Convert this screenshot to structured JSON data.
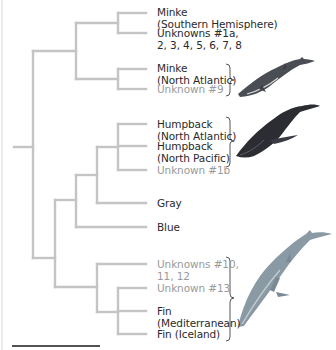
{
  "tree": {
    "branch_color": "#c4c4c4",
    "known_text_color": "#2a2a2a",
    "unknown_text_color": "#9a9a9a",
    "leaves": [
      {
        "id": "minke-sh",
        "lines": [
          "Minke",
          "(Southern Hemisphere)"
        ],
        "unknown": false
      },
      {
        "id": "unknowns-1a-8",
        "lines": [
          "Unknowns #1a,",
          "2, 3, 4, 5, 6, 7, 8"
        ],
        "unknown": false
      },
      {
        "id": "minke-na",
        "lines": [
          "Minke",
          "(North Atlantic)"
        ],
        "unknown": false
      },
      {
        "id": "unknown-9",
        "lines": [
          "Unknown #9"
        ],
        "unknown": true
      },
      {
        "id": "humpback-na",
        "lines": [
          "Humpback",
          "(North Atlantic)"
        ],
        "unknown": false
      },
      {
        "id": "humpback-np",
        "lines": [
          "Humpback",
          "(North Pacific)"
        ],
        "unknown": false
      },
      {
        "id": "unknown-1b",
        "lines": [
          "Unknown #1b"
        ],
        "unknown": true
      },
      {
        "id": "gray",
        "lines": [
          "Gray"
        ],
        "unknown": false
      },
      {
        "id": "blue",
        "lines": [
          "Blue"
        ],
        "unknown": false
      },
      {
        "id": "unknowns-10-12",
        "lines": [
          "Unknowns #10,",
          "11, 12"
        ],
        "unknown": true
      },
      {
        "id": "unknown-13",
        "lines": [
          "Unknown #13"
        ],
        "unknown": true
      },
      {
        "id": "fin-med",
        "lines": [
          "Fin",
          "(Mediterranean)"
        ],
        "unknown": false
      },
      {
        "id": "fin-iceland",
        "lines": [
          "Fin (Iceland)"
        ],
        "unknown": false
      }
    ]
  },
  "illustrations": [
    {
      "name": "minke-whale",
      "group": "Minke (North Atlantic) / Unknown #9"
    },
    {
      "name": "humpback-whale",
      "group": "Humpback / Unknown #1b"
    },
    {
      "name": "fin-whale",
      "group": "Unknowns #10-13 / Fin"
    }
  ]
}
